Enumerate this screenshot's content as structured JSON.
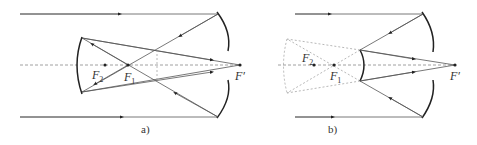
{
  "diagrams": [
    {
      "id": "a",
      "caption": "a)",
      "labels": {
        "f2": "F",
        "f2_sub": "2",
        "f1": "F",
        "f1_sub": "1",
        "fprime": "F′"
      }
    },
    {
      "id": "b",
      "caption": "b)",
      "labels": {
        "f2": "F",
        "f2_sub": "2",
        "f1": "F",
        "f1_sub": "1",
        "fprime": "F′"
      }
    }
  ],
  "colors": {
    "ray": "#555555",
    "mirror": "#222222",
    "axis": "#888888",
    "virtual": "#999999"
  }
}
